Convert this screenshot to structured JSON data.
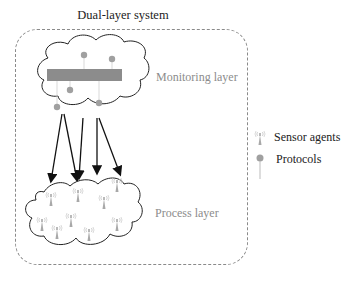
{
  "diagram": {
    "title": "Dual-layer system",
    "monitoring_layer": {
      "label": "Monitoring layer",
      "protocol_count": 5
    },
    "process_layer": {
      "label": "Process layer",
      "sensor_count": 10
    },
    "arrows": {
      "count": 5,
      "direction": "monitoring-to-process"
    },
    "legend": {
      "items": [
        {
          "icon": "sensor-antenna-icon",
          "label": "Sensor agents"
        },
        {
          "icon": "protocol-pin-icon",
          "label": "Protocols"
        }
      ]
    },
    "colors": {
      "bar": "#8c8c8c",
      "protocol_dot": "#a0a0a0",
      "sensor": "#a8a8a8",
      "outline": "#222222",
      "frame": "#8a8a8a"
    }
  }
}
